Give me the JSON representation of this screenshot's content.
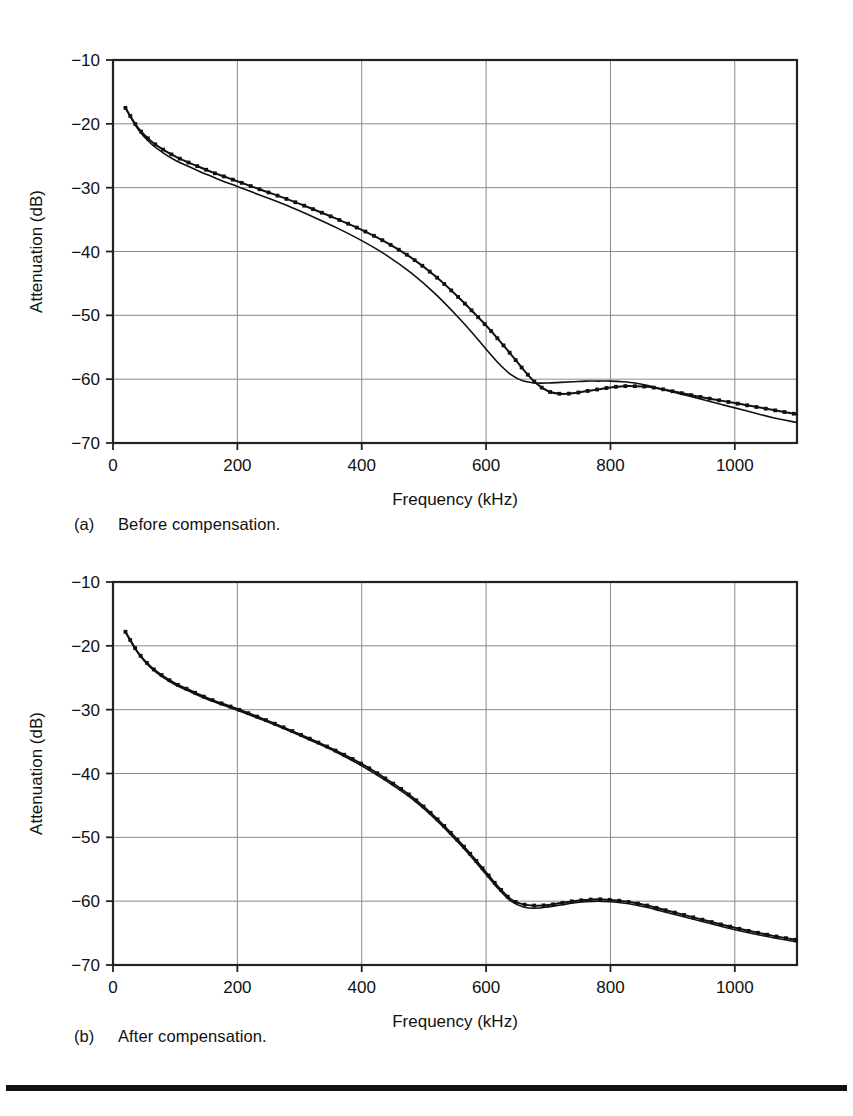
{
  "figure": {
    "background_color": "#ffffff",
    "ink_color": "#111111",
    "grid_color": "#8a8a8a",
    "frame_color": "#222222"
  },
  "panels": [
    {
      "id": "a",
      "caption_tag": "(a)",
      "caption_text": "Before compensation.",
      "chart_data": {
        "type": "line",
        "title": "",
        "xlabel": "Frequency (kHz)",
        "ylabel": "Attenuation (dB)",
        "xlim": [
          0,
          1100
        ],
        "ylim": [
          -70,
          -10
        ],
        "xticks": [
          0,
          200,
          400,
          600,
          800,
          1000
        ],
        "xtick_labels": [
          "0",
          "200",
          "400",
          "600",
          "800",
          "1000"
        ],
        "yticks": [
          -10,
          -20,
          -30,
          -40,
          -50,
          -60,
          -70
        ],
        "ytick_labels": [
          "-10",
          "-20",
          "-30",
          "-40",
          "-50",
          "-60",
          "-70"
        ],
        "grid": true,
        "grid_axis": "both",
        "legend": "none",
        "series": [
          {
            "name": "measured",
            "marker": "dot",
            "x": [
              20,
              40,
              60,
              80,
              100,
              120,
              140,
              160,
              180,
              200,
              240,
              280,
              320,
              360,
              400,
              440,
              480,
              520,
              560,
              600,
              620,
              640,
              660,
              680,
              700,
              720,
              740,
              760,
              780,
              800,
              820,
              840,
              860,
              880,
              900,
              940,
              980,
              1020,
              1060,
              1100
            ],
            "y": [
              -17.5,
              -20.6,
              -22.6,
              -24.0,
              -25.1,
              -26.0,
              -26.8,
              -27.6,
              -28.3,
              -29.0,
              -30.4,
              -31.8,
              -33.3,
              -34.9,
              -36.6,
              -38.6,
              -41.0,
              -44.0,
              -47.6,
              -51.6,
              -53.8,
              -56.1,
              -58.5,
              -60.6,
              -61.9,
              -62.3,
              -62.2,
              -61.9,
              -61.6,
              -61.3,
              -61.1,
              -61.1,
              -61.2,
              -61.5,
              -61.9,
              -62.7,
              -63.4,
              -64.1,
              -64.8,
              -65.5
            ]
          },
          {
            "name": "simulated",
            "marker": "none",
            "x": [
              20,
              40,
              60,
              80,
              100,
              120,
              140,
              160,
              180,
              200,
              240,
              280,
              320,
              360,
              400,
              440,
              480,
              520,
              560,
              580,
              600,
              620,
              640,
              660,
              680,
              700,
              720,
              740,
              760,
              780,
              800,
              820,
              840,
              860,
              880,
              900,
              940,
              980,
              1020,
              1060,
              1100
            ],
            "y": [
              -17.5,
              -20.8,
              -23.0,
              -24.5,
              -25.7,
              -26.6,
              -27.5,
              -28.3,
              -29.1,
              -29.8,
              -31.3,
              -32.8,
              -34.5,
              -36.3,
              -38.3,
              -40.6,
              -43.4,
              -46.8,
              -50.8,
              -53.0,
              -55.3,
              -57.5,
              -59.3,
              -60.3,
              -60.6,
              -60.6,
              -60.5,
              -60.4,
              -60.3,
              -60.3,
              -60.3,
              -60.4,
              -60.6,
              -61.0,
              -61.5,
              -62.0,
              -63.0,
              -64.0,
              -65.0,
              -66.0,
              -66.8
            ]
          }
        ]
      }
    },
    {
      "id": "b",
      "caption_tag": "(b)",
      "caption_text": "After compensation.",
      "chart_data": {
        "type": "line",
        "title": "",
        "xlabel": "Frequency (kHz)",
        "ylabel": "Attenuation (dB)",
        "xlim": [
          0,
          1100
        ],
        "ylim": [
          -70,
          -10
        ],
        "xticks": [
          0,
          200,
          400,
          600,
          800,
          1000
        ],
        "xtick_labels": [
          "0",
          "200",
          "400",
          "600",
          "800",
          "1000"
        ],
        "yticks": [
          -10,
          -20,
          -30,
          -40,
          -50,
          -60,
          -70
        ],
        "ytick_labels": [
          "-10",
          "-20",
          "-30",
          "-40",
          "-50",
          "-60",
          "-70"
        ],
        "grid": true,
        "grid_axis": "both",
        "legend": "none",
        "series": [
          {
            "name": "measured",
            "marker": "dot",
            "x": [
              20,
              40,
              60,
              80,
              100,
              120,
              140,
              160,
              180,
              200,
              240,
              280,
              320,
              360,
              400,
              440,
              480,
              520,
              560,
              580,
              600,
              620,
              640,
              660,
              680,
              700,
              720,
              740,
              760,
              780,
              800,
              820,
              840,
              860,
              880,
              900,
              940,
              980,
              1020,
              1060,
              1100
            ],
            "y": [
              -17.8,
              -21.0,
              -23.2,
              -24.7,
              -25.9,
              -26.8,
              -27.7,
              -28.5,
              -29.2,
              -29.9,
              -31.4,
              -33.0,
              -34.7,
              -36.5,
              -38.5,
              -40.9,
              -43.6,
              -47.0,
              -51.0,
              -53.2,
              -55.5,
              -57.8,
              -59.7,
              -60.5,
              -60.7,
              -60.6,
              -60.3,
              -60.0,
              -59.8,
              -59.7,
              -59.8,
              -60.0,
              -60.3,
              -60.7,
              -61.2,
              -61.7,
              -62.7,
              -63.7,
              -64.6,
              -65.4,
              -66.1
            ]
          },
          {
            "name": "simulated",
            "marker": "none",
            "x": [
              20,
              40,
              60,
              80,
              100,
              120,
              140,
              160,
              180,
              200,
              240,
              280,
              320,
              360,
              400,
              440,
              480,
              520,
              560,
              580,
              600,
              620,
              640,
              660,
              680,
              700,
              720,
              740,
              760,
              780,
              800,
              820,
              840,
              860,
              880,
              900,
              940,
              980,
              1020,
              1060,
              1100
            ],
            "y": [
              -17.8,
              -21.1,
              -23.4,
              -24.9,
              -26.1,
              -27.0,
              -27.9,
              -28.7,
              -29.4,
              -30.1,
              -31.6,
              -33.2,
              -34.9,
              -36.7,
              -38.8,
              -41.2,
              -43.9,
              -47.3,
              -51.3,
              -53.5,
              -55.8,
              -58.1,
              -60.0,
              -60.9,
              -61.1,
              -60.9,
              -60.6,
              -60.3,
              -60.1,
              -60.0,
              -60.1,
              -60.3,
              -60.6,
              -61.0,
              -61.5,
              -62.0,
              -63.0,
              -64.0,
              -64.9,
              -65.7,
              -66.4
            ]
          }
        ]
      }
    }
  ]
}
